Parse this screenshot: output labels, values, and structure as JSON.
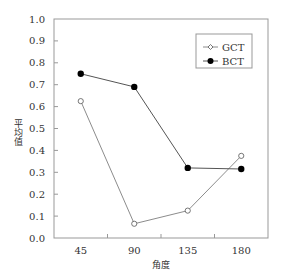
{
  "chart_data": {
    "type": "line",
    "title": "",
    "xlabel": "角度",
    "ylabel": "平均值",
    "categories": [
      "45",
      "90",
      "135",
      "180"
    ],
    "ylim": [
      0.0,
      1.0
    ],
    "yticks": [
      "0.0",
      "0.1",
      "0.2",
      "0.3",
      "0.4",
      "0.5",
      "0.6",
      "0.7",
      "0.8",
      "0.9",
      "1.0"
    ],
    "grid": false,
    "legend_position": "upper right (inside)",
    "series": [
      {
        "name": "GCT",
        "marker": "open-diamond",
        "color": "#8c8c8c",
        "values": [
          0.625,
          0.065,
          0.125,
          0.375
        ]
      },
      {
        "name": "BCT",
        "marker": "filled-circle",
        "color": "#000000",
        "values": [
          0.75,
          0.69,
          0.32,
          0.315
        ]
      }
    ]
  },
  "axes": {
    "x_title": "角度",
    "y_title": "平均值"
  },
  "legend": {
    "items": [
      {
        "label": "GCT",
        "icon": "open-diamond-marker-icon"
      },
      {
        "label": "BCT",
        "icon": "filled-circle-marker-icon"
      }
    ]
  }
}
